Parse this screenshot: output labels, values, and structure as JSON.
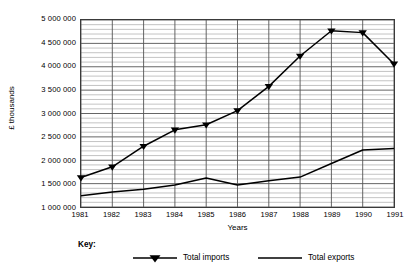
{
  "chart_data": {
    "type": "line",
    "title": "",
    "xlabel": "Years",
    "ylabel": "£ thousands",
    "categories": [
      "1981",
      "1982",
      "1983",
      "1984",
      "1985",
      "1986",
      "1987",
      "1988",
      "1989",
      "1990",
      "1991"
    ],
    "x": [
      1981,
      1982,
      1983,
      1984,
      1985,
      1986,
      1987,
      1988,
      1989,
      1990,
      1991
    ],
    "xlim": [
      1981,
      1991
    ],
    "ylim": [
      1000000,
      5000000
    ],
    "ytick_labels": [
      "5 000 000",
      "4 500 000",
      "4 000 000",
      "3 500 000",
      "3 000 000",
      "2 500 000",
      "2 000 000",
      "1 500 000",
      "1 000 000"
    ],
    "ytick_values": [
      5000000,
      4500000,
      4000000,
      3500000,
      3000000,
      2500000,
      2000000,
      1500000,
      1000000
    ],
    "grid": true,
    "grid_major_step": 500000,
    "grid_minor_step": 100000,
    "legend_position": "bottom",
    "series": [
      {
        "name": "Total imports",
        "marker": "triangle-down",
        "values": [
          1630000,
          1860000,
          2300000,
          2650000,
          2760000,
          3060000,
          3580000,
          4230000,
          4770000,
          4730000,
          4060000
        ]
      },
      {
        "name": "Total exports",
        "marker": "none",
        "values": [
          1240000,
          1320000,
          1380000,
          1470000,
          1620000,
          1470000,
          1560000,
          1640000,
          1930000,
          2220000,
          2250000
        ]
      }
    ]
  },
  "axes": {
    "y_title": "£ thousands",
    "x_title": "Years"
  },
  "key": {
    "label": "Key:",
    "entries": [
      {
        "label": "Total imports"
      },
      {
        "label": "Total exports"
      }
    ]
  },
  "colors": {
    "line": "#000000",
    "frame": "#3a3a3a",
    "grid_major": "#555555",
    "grid_minor": "#9a9a9a",
    "background": "#ffffff"
  }
}
